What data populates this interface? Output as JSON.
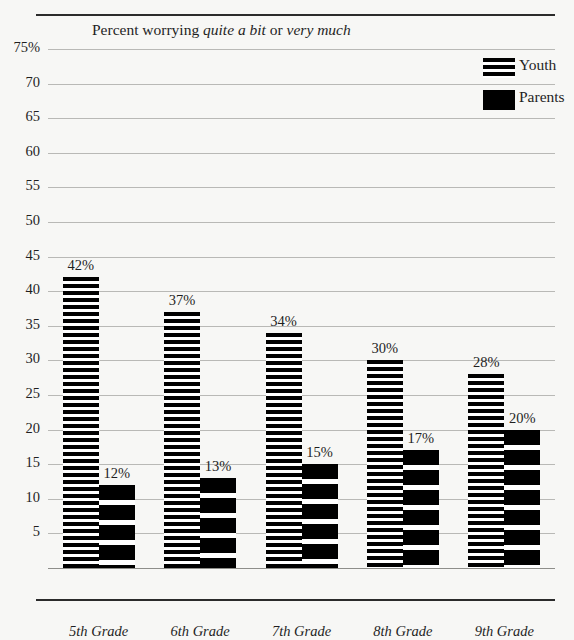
{
  "title": {
    "prefix": "Percent worrying ",
    "em1": "quite a bit",
    "middle": " or ",
    "em2": "very much",
    "full": "Percent worrying quite a bit or very much"
  },
  "legend": {
    "items": [
      {
        "label": "Youth",
        "swatch": "striped-fine",
        "color": "#000000"
      },
      {
        "label": "Parents",
        "swatch": "solid-black",
        "color": "#000000"
      }
    ]
  },
  "axis": {
    "y_ticks": [
      "75%",
      "70",
      "65",
      "60",
      "55",
      "50",
      "45",
      "40",
      "35",
      "30",
      "25",
      "20",
      "15",
      "10",
      "5"
    ],
    "y_values": [
      75,
      70,
      65,
      60,
      55,
      50,
      45,
      40,
      35,
      30,
      25,
      20,
      15,
      10,
      5
    ]
  },
  "chart_data": {
    "type": "bar",
    "title": "Percent worrying quite a bit or very much",
    "xlabel": "",
    "ylabel": "",
    "ylim": [
      0,
      75
    ],
    "ytick_step": 5,
    "grid": true,
    "legend_position": "top-right",
    "categories": [
      "5th Grade",
      "6th Grade",
      "7th Grade",
      "8th Grade",
      "9th Grade"
    ],
    "series": [
      {
        "name": "Youth",
        "values": [
          42,
          37,
          34,
          30,
          28
        ],
        "labels": [
          "42%",
          "37%",
          "34%",
          "30%",
          "28%"
        ]
      },
      {
        "name": "Parents",
        "values": [
          12,
          13,
          15,
          17,
          20
        ],
        "labels": [
          "12%",
          "13%",
          "15%",
          "17%",
          "20%"
        ]
      }
    ]
  },
  "colors": {
    "background": "#f7f7f5",
    "ink": "#1f1f1f",
    "gridline": "#b9b9b6",
    "rule": "#2b2b2b"
  }
}
